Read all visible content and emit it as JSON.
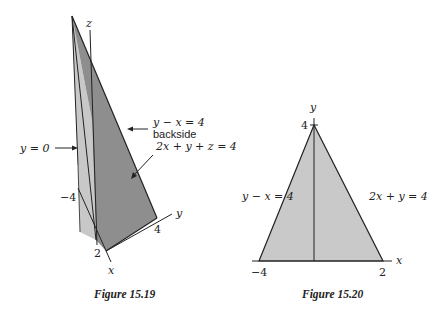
{
  "figures": [
    {
      "id": "figure-15-19",
      "caption": "Figure 15.19",
      "axes": {
        "z_label": "z",
        "y_label": "y",
        "x_label": "x"
      },
      "ticks": {
        "x_neg": "−4",
        "x_pos": "2",
        "y_pos": "4"
      },
      "annotations": {
        "plane_y0": "y = 0",
        "plane_yx": "y − x = 4",
        "backside": "backside",
        "plane_2xyz": "2x + y + z = 4"
      },
      "colors": {
        "light_face": "#c8c8c8",
        "dark_face": "#8e8e8e",
        "line": "#222222"
      }
    },
    {
      "id": "figure-15-20",
      "caption": "Figure 15.20",
      "axes": {
        "y_label": "y",
        "x_label": "x"
      },
      "ticks": {
        "y_top": "4",
        "x_neg": "−4",
        "x_pos": "2"
      },
      "annotations": {
        "left_edge": "y − x = 4",
        "right_edge": "2x + y = 4"
      },
      "colors": {
        "region_fill": "#c9c9c9",
        "line": "#222222"
      }
    }
  ]
}
